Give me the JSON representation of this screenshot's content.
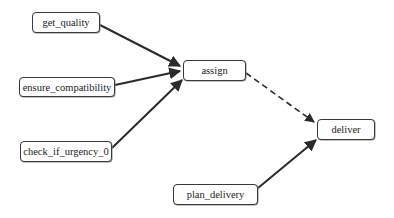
{
  "diagram": {
    "type": "flow-graph",
    "nodes": [
      {
        "id": "get_quality",
        "label": "get_quality",
        "x": 32,
        "y": 12,
        "w": 68,
        "h": 21
      },
      {
        "id": "ensure_compatibility",
        "label": "ensure_compatibility",
        "x": 19,
        "y": 77,
        "w": 96,
        "h": 20
      },
      {
        "id": "check_if_urgency_0",
        "label": "check_if_urgency_0",
        "x": 20,
        "y": 141,
        "w": 92,
        "h": 21
      },
      {
        "id": "assign",
        "label": "assign",
        "x": 183,
        "y": 60,
        "w": 63,
        "h": 21
      },
      {
        "id": "deliver",
        "label": "deliver",
        "x": 317,
        "y": 119,
        "w": 58,
        "h": 21
      },
      {
        "id": "plan_delivery",
        "label": "plan_delivery",
        "x": 173,
        "y": 184,
        "w": 85,
        "h": 21
      }
    ],
    "edges": [
      {
        "from": "get_quality",
        "to": "assign",
        "style": "solid"
      },
      {
        "from": "ensure_compatibility",
        "to": "assign",
        "style": "solid"
      },
      {
        "from": "check_if_urgency_0",
        "to": "assign",
        "style": "solid"
      },
      {
        "from": "assign",
        "to": "deliver",
        "style": "dashed"
      },
      {
        "from": "plan_delivery",
        "to": "deliver",
        "style": "solid"
      }
    ],
    "colors": {
      "stroke": "#2a2a2a",
      "node_border": "#3a3a3a",
      "background": "#ffffff"
    }
  }
}
